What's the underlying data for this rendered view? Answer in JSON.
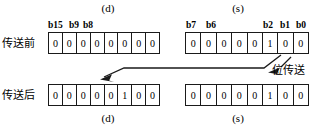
{
  "figure": {
    "captions": {
      "dest_top": "(d)",
      "src_top": "(s)",
      "dest_bottom": "(d)",
      "src_bottom": "(s)"
    },
    "row_labels": {
      "before": "传送前",
      "after": "传送后"
    },
    "annotation": "位传送",
    "colors": {
      "line": "#1a1a1a",
      "background": "#ffffff",
      "text": "#000000"
    }
  },
  "registers": {
    "dest": {
      "bit_labels": [
        "b15",
        "b9",
        "b8"
      ],
      "before": [
        "0",
        "0",
        "0",
        "0",
        "0",
        "0",
        "0",
        "0"
      ],
      "after": [
        "0",
        "0",
        "0",
        "0",
        "0",
        "1",
        "0",
        "0"
      ]
    },
    "src": {
      "bit_labels": [
        "b7",
        "b6",
        "b2",
        "b1",
        "b0"
      ],
      "before": [
        "0",
        "0",
        "0",
        "0",
        "0",
        "1",
        "0",
        "0"
      ],
      "after": [
        "0",
        "0",
        "0",
        "0",
        "0",
        "1",
        "0",
        "0"
      ]
    }
  }
}
